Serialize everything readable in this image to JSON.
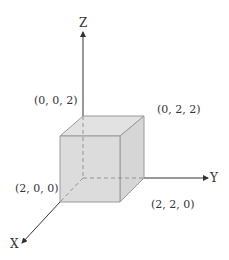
{
  "diagram": {
    "type": "3d-coordinate-cube",
    "axes": {
      "x": {
        "label": "X"
      },
      "y": {
        "label": "Y"
      },
      "z": {
        "label": "Z"
      }
    },
    "vertices": [
      {
        "id": "v002",
        "label": "(0, 0, 2)"
      },
      {
        "id": "v022",
        "label": "(0, 2, 2)"
      },
      {
        "id": "v200",
        "label": "(2, 0, 0)"
      },
      {
        "id": "v220",
        "label": "(2, 2, 0)"
      }
    ],
    "colors": {
      "cube_fill": "#dcdcdc",
      "cube_edge": "#9a9a9a",
      "axis": "#333333",
      "hidden_edge": "#8a8a8a"
    }
  }
}
